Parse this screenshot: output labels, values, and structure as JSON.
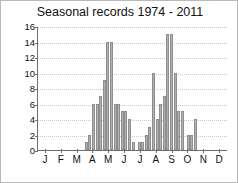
{
  "chart_data": {
    "type": "bar",
    "title": "Seasonal records 1974 - 2011",
    "xlabel": "",
    "ylabel": "",
    "ylim": [
      0,
      16
    ],
    "yticks": [
      0,
      2,
      4,
      6,
      8,
      10,
      12,
      14,
      16
    ],
    "grid": true,
    "legend": null,
    "xtick_labels": [
      "J",
      "F",
      "M",
      "A",
      "M",
      "J",
      "J",
      "A",
      "S",
      "O",
      "N",
      "D"
    ],
    "xtick_positions": [
      4.17,
      12.5,
      20.83,
      29.17,
      37.5,
      45.83,
      54.17,
      62.5,
      70.83,
      79.17,
      87.5,
      95.83
    ],
    "bar_color": "#b0b0b0",
    "bar_edge_color": "#8e8e8e",
    "x": [
      25.6,
      27.5,
      29.4,
      31.3,
      33.2,
      35.1,
      37.0,
      38.9,
      40.8,
      42.7,
      44.6,
      46.5,
      48.4,
      50.3,
      53.5,
      55.4,
      57.3,
      59.2,
      61.1,
      63.0,
      64.9,
      66.8,
      68.7,
      70.6,
      72.5,
      74.4,
      76.3,
      79.5,
      81.4,
      83.3
    ],
    "values": [
      1,
      2,
      6,
      6,
      7,
      9,
      14,
      14,
      6,
      6,
      5,
      5,
      4,
      1,
      1,
      1,
      2,
      3,
      10,
      4,
      6,
      7,
      15,
      15,
      10,
      5,
      5,
      2,
      2,
      4
    ],
    "value_labels": []
  }
}
